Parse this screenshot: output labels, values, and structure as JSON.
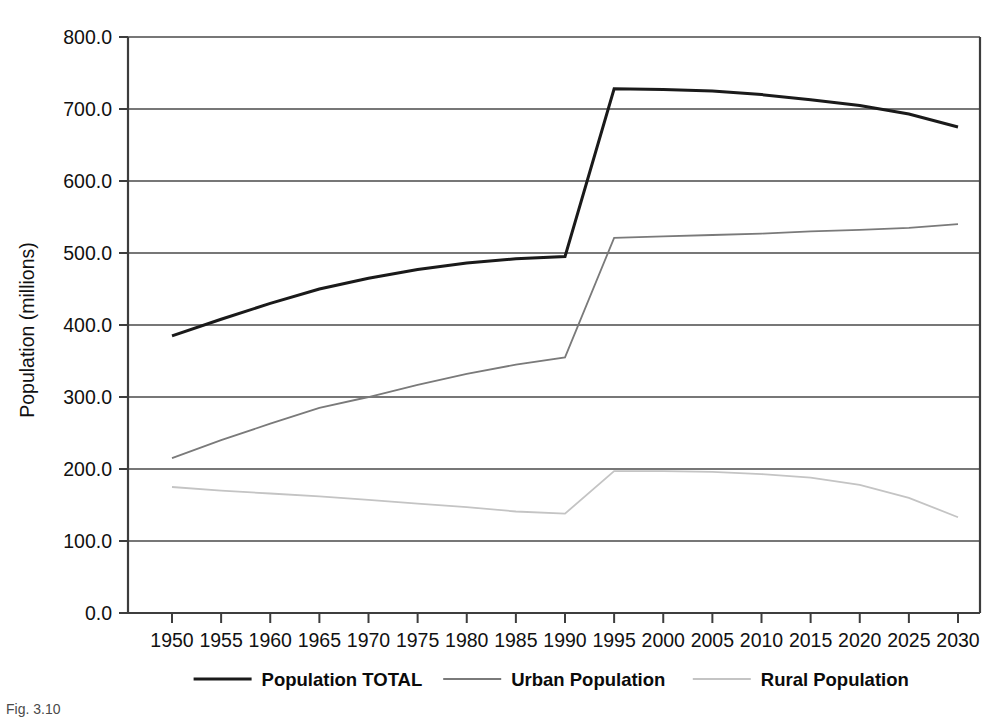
{
  "figure": {
    "caption": "Fig. 3.10"
  },
  "axes": {
    "ylabel": "Population (millions)",
    "xlabel": "",
    "y_ticks": [
      "0.0",
      "100.0",
      "200.0",
      "300.0",
      "400.0",
      "500.0",
      "600.0",
      "700.0",
      "800.0"
    ],
    "x_ticks": [
      "1950",
      "1955",
      "1960",
      "1965",
      "1970",
      "1975",
      "1980",
      "1985",
      "1990",
      "1995",
      "2000",
      "2005",
      "2010",
      "2015",
      "2020",
      "2025",
      "2030"
    ]
  },
  "legend": {
    "position": "bottom",
    "items": [
      {
        "label": "Population TOTAL",
        "color": "#1a1a1a"
      },
      {
        "label": "Urban Population",
        "color": "#7a7a7a"
      },
      {
        "label": "Rural Population",
        "color": "#c4c4c4"
      }
    ]
  },
  "chart_data": {
    "type": "line",
    "title": "",
    "xlabel": "",
    "ylabel": "Population (millions)",
    "xlim": [
      1950,
      2030
    ],
    "ylim": [
      0,
      800
    ],
    "grid": true,
    "legend_position": "bottom",
    "x": [
      1950,
      1955,
      1960,
      1965,
      1970,
      1975,
      1980,
      1985,
      1990,
      1995,
      2000,
      2005,
      2010,
      2015,
      2020,
      2025,
      2030
    ],
    "series": [
      {
        "name": "Population TOTAL",
        "color": "#1a1a1a",
        "width": 3.0,
        "values": [
          385,
          408,
          430,
          450,
          465,
          477,
          486,
          492,
          495,
          728,
          727,
          725,
          720,
          713,
          705,
          693,
          675
        ]
      },
      {
        "name": "Urban Population",
        "color": "#7a7a7a",
        "width": 1.8,
        "values": [
          215,
          240,
          263,
          285,
          300,
          317,
          332,
          345,
          355,
          521,
          523,
          525,
          527,
          530,
          532,
          535,
          540
        ]
      },
      {
        "name": "Rural Population",
        "color": "#c4c4c4",
        "width": 1.8,
        "values": [
          175,
          170,
          166,
          162,
          157,
          152,
          147,
          141,
          138,
          197,
          197,
          196,
          193,
          188,
          178,
          160,
          133
        ]
      }
    ]
  },
  "geometry": {
    "plot_left": 128,
    "plot_right": 980,
    "plot_top": 37,
    "plot_bottom": 613,
    "data_left": 172,
    "data_right": 958
  }
}
